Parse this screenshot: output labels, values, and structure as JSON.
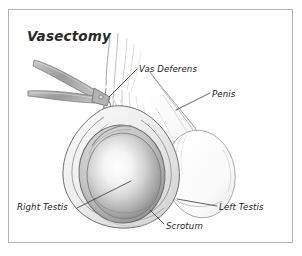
{
  "figure": {
    "title": "Vasectomy",
    "type": "medical-illustration",
    "style": "pencil / graphite grayscale line drawing",
    "background_color": "#ffffff",
    "frame_color": "#b4b4b4",
    "ink_color": "#2b2b2b",
    "label_color": "#232323"
  },
  "labels": {
    "vas_deferens": "Vas Deferens",
    "penis": "Penis",
    "right_testis": "Right Testis",
    "left_testis": "Left Testis",
    "scrotum": "Scrotum"
  },
  "icon_names": {
    "frame": "figure-border",
    "forceps": "surgical-forceps-icon",
    "right_testis_shape": "right-testis-shape",
    "left_testis_shape": "left-testis-shape",
    "scrotum_shape": "scrotum-shape",
    "penis_shape": "penis-shaft-shape",
    "cord_shape": "spermatic-cord-shape"
  }
}
